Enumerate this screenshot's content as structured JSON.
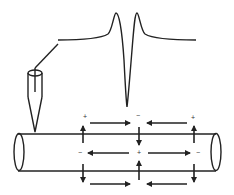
{
  "diagram": {
    "title": "",
    "components": {
      "electrode": {
        "label": "recording electrode"
      },
      "waveform": {
        "label": "extracellular action potential (biphasic/triphasic)"
      },
      "axon": {
        "label": "axon cylinder with local current loops"
      }
    },
    "signs": {
      "top_left": "+",
      "top_mid": "−",
      "top_right": "+",
      "mid_left": "−",
      "mid_mid": "+",
      "mid_right": "−"
    },
    "colors": {
      "line": "#222222",
      "background": "#ffffff"
    }
  }
}
